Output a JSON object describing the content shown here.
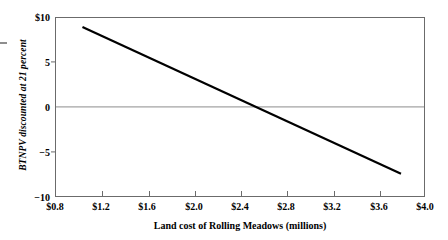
{
  "chart_data": {
    "type": "line",
    "title": "",
    "xlabel": "Land cost of Rolling Meadows (millions)",
    "ylabel": "BTNPV discounted at 21 percent",
    "xlim": [
      0.8,
      4.0
    ],
    "ylim": [
      -10,
      10
    ],
    "grid": false,
    "legend": null,
    "zero_reference_line": true,
    "xticks": [
      0.8,
      1.2,
      1.6,
      2.0,
      2.4,
      2.8,
      3.2,
      3.6,
      4.0
    ],
    "xticklabels": [
      "$0.8",
      "$1.2",
      "$1.6",
      "$2.0",
      "$2.4",
      "$2.8",
      "$3.2",
      "$3.6",
      "$4.0"
    ],
    "yticks": [
      10,
      5,
      0,
      -5,
      -10
    ],
    "yticklabels": [
      "$10",
      "5",
      "0",
      "−5",
      "−10"
    ],
    "series": [
      {
        "name": "BTNPV vs land cost",
        "x": [
          1.03,
          3.8
        ],
        "values": [
          9.0,
          -7.5
        ],
        "x_intercept": 2.55,
        "slope": -5.96,
        "color": "#000000"
      }
    ]
  },
  "axis_titles": {
    "x": "Land cost of Rolling Meadows (millions)",
    "y_italic_prefix": "BTNPV",
    "y_rest": " discounted at 21 percent"
  }
}
